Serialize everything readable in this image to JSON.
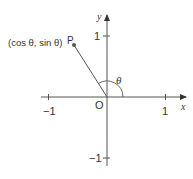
{
  "diagram": {
    "origin_label": "O",
    "x_axis_label": "x",
    "y_axis_label": "y",
    "x_ticks": [
      {
        "value": -1,
        "label": "−1"
      },
      {
        "value": 1,
        "label": "1"
      }
    ],
    "y_ticks": [
      {
        "value": 1,
        "label": "1"
      },
      {
        "value": -1,
        "label": "−1"
      }
    ],
    "point": {
      "name": "P",
      "coordinate_label": "(cos θ, sin θ)"
    },
    "angle_label": "θ",
    "colors": {
      "line": "#555555",
      "text": "#333333",
      "point": "#555555"
    }
  }
}
